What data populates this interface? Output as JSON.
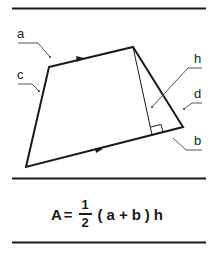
{
  "diagram": {
    "labels": {
      "a": "a",
      "b": "b",
      "c": "c",
      "d": "d",
      "h": "h"
    },
    "colors": {
      "line": "#1a1a1a",
      "leader": "#555555"
    }
  },
  "formula": {
    "lhs": "A",
    "equals": "=",
    "numerator": "1",
    "denominator": "2",
    "open_paren": "(",
    "a": "a",
    "plus": "+",
    "b": "b",
    "close_paren": ")",
    "h": "h"
  }
}
